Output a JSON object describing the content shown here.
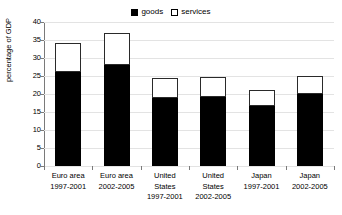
{
  "chart_data": {
    "type": "bar",
    "subtype": "stacked-bar",
    "title": "",
    "xlabel": "",
    "ylabel": "percentage of GDP",
    "ylim": [
      0,
      40
    ],
    "ytick_step": 5,
    "ytick_labels": [
      "0",
      "5",
      "10",
      "15",
      "20",
      "25",
      "30",
      "35",
      "40"
    ],
    "grid": true,
    "legend_position": "top-center",
    "categories": [
      "Euro area 1997-2001",
      "Euro area 2002-2005",
      "United States 1997-2001",
      "United States 2002-2005",
      "Japan 1997-2001",
      "Japan 2002-2005"
    ],
    "category_lines": [
      [
        "Euro area",
        "1997-2001"
      ],
      [
        "Euro area",
        "2002-2005"
      ],
      [
        "United",
        "States",
        "1997-2001"
      ],
      [
        "United",
        "States",
        "2002-2005"
      ],
      [
        "Japan",
        "1997-2001"
      ],
      [
        "Japan",
        "2002-2005"
      ]
    ],
    "series": [
      {
        "name": "goods",
        "color": "#000000",
        "values": [
          26.0,
          28.0,
          19.0,
          19.1,
          16.8,
          20.1
        ]
      },
      {
        "name": "services",
        "color": "#ffffff",
        "values": [
          8.2,
          9.0,
          5.5,
          5.7,
          4.4,
          5.0
        ]
      }
    ],
    "totals": [
      34.2,
      37.0,
      24.5,
      24.8,
      21.2,
      25.1
    ]
  },
  "legend": {
    "items": [
      {
        "label": "goods",
        "swatch": "filled-square-icon"
      },
      {
        "label": "services",
        "swatch": "empty-square-icon"
      }
    ]
  },
  "axis": {
    "y_title": "percentage of GDP"
  },
  "colors": {
    "goods": "#000000",
    "services": "#ffffff",
    "axis": "#7a7a7a",
    "grid": "#e3e3e3",
    "outline": "#2a2a2a"
  }
}
